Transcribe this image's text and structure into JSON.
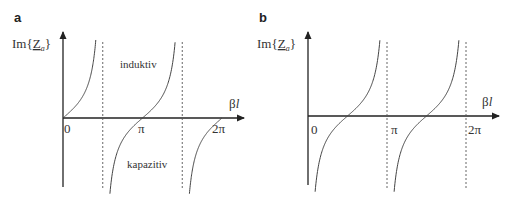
{
  "chart_data": [
    {
      "type": "line",
      "panel": "a",
      "title": "a",
      "ylabel": "Im{Z_a}",
      "ylabel_main": "Im{",
      "ylabel_symbol": "Z",
      "ylabel_sub": "a",
      "ylabel_close": "}",
      "xlabel": "βl",
      "xlabel_beta": "β",
      "xlabel_l": "l",
      "xlim": [
        0,
        "2π"
      ],
      "x_range_numeric": [
        0,
        6.2832
      ],
      "tick_labels": [
        "0",
        "π",
        "2π"
      ],
      "tick_values": [
        0,
        3.1416,
        6.2832
      ],
      "asymptotes": [
        "π/2",
        "3π/2"
      ],
      "asymptote_values": [
        1.5708,
        4.7124
      ],
      "function": "tan(βl)",
      "annotations": [
        "induktiv",
        "kapazitiv"
      ],
      "grid": false,
      "legend": "none"
    },
    {
      "type": "line",
      "panel": "b",
      "title": "b",
      "ylabel": "Im{Z_a}",
      "ylabel_main": "Im{",
      "ylabel_symbol": "Z",
      "ylabel_sub": "a",
      "ylabel_close": "}",
      "xlabel": "βl",
      "xlabel_beta": "β",
      "xlabel_l": "l",
      "xlim": [
        0,
        "2π"
      ],
      "x_range_numeric": [
        0,
        6.2832
      ],
      "tick_labels": [
        "0",
        "π",
        "2π"
      ],
      "tick_values": [
        0,
        3.1416,
        6.2832
      ],
      "asymptotes": [
        "0",
        "π",
        "2π"
      ],
      "asymptote_values": [
        0,
        3.1416,
        6.2832
      ],
      "function": "-cot(βl)",
      "annotations": [],
      "grid": false,
      "legend": "none"
    }
  ]
}
